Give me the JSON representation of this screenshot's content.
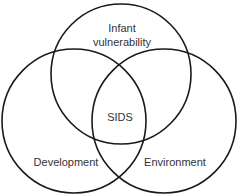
{
  "diagram": {
    "type": "venn",
    "stroke_color": "#1a1a1a",
    "background": "#ffffff",
    "sets": [
      {
        "id": "infant-vulnerability",
        "label_lines": [
          "Infant",
          "vulnerability"
        ]
      },
      {
        "id": "development",
        "label": "Development"
      },
      {
        "id": "environment",
        "label": "Environment"
      }
    ],
    "intersection": {
      "label": "SIDS"
    }
  }
}
